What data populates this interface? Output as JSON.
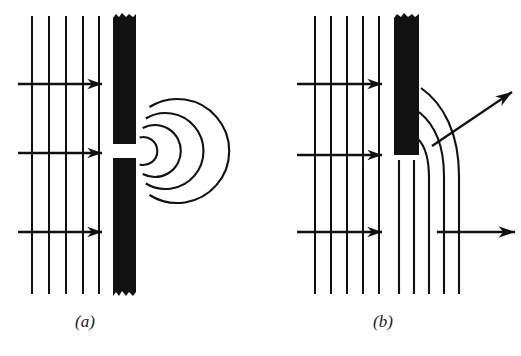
{
  "figure": {
    "background_color": "#ffffff",
    "ink_color": "#111111",
    "panels": [
      {
        "id": "a",
        "caption": "(a)",
        "caption_x": 85,
        "caption_y": 327,
        "description": "Plane waves incident on a barrier with a narrow slit; circular wavelets spread out beyond the slit",
        "incident_wavefronts": {
          "count": 5,
          "x_positions": [
            32,
            49,
            66,
            83,
            99
          ],
          "y_top": 16,
          "y_bottom": 294,
          "stroke_width": 2.0
        },
        "direction_arrows": [
          {
            "x1": 18,
            "y1": 84,
            "x2": 102,
            "y2": 84
          },
          {
            "x1": 18,
            "y1": 153,
            "x2": 102,
            "y2": 153
          },
          {
            "x1": 18,
            "y1": 232,
            "x2": 102,
            "y2": 232
          }
        ],
        "barrier": {
          "x": 113,
          "width": 23,
          "top_segment": {
            "y_top": 14,
            "y_bottom": 144
          },
          "bottom_segment": {
            "y_top": 158,
            "y_bottom": 296
          },
          "slit": {
            "y_top": 144,
            "y_bottom": 158,
            "height": 14
          },
          "fill": "#111111",
          "torn_edges": true
        },
        "diffracted_arcs": {
          "center_x": 136,
          "center_y": 151,
          "radii": [
            14,
            26,
            38,
            52
          ],
          "angle_span_degrees": 150,
          "stroke_width": 2.0
        }
      },
      {
        "id": "b",
        "caption": "(b)",
        "caption_x": 383,
        "caption_y": 327,
        "description": "Plane waves incident on a straight edge; wavefronts bend around the edge into the shadow region",
        "incident_wavefronts": {
          "count": 5,
          "x_positions": [
            315,
            331,
            347,
            363,
            379
          ],
          "y_top": 16,
          "y_bottom": 294,
          "stroke_width": 2.0
        },
        "direction_arrows": [
          {
            "x1": 297,
            "y1": 84,
            "x2": 382,
            "y2": 84
          },
          {
            "x1": 297,
            "y1": 155,
            "x2": 382,
            "y2": 155
          },
          {
            "x1": 297,
            "y1": 232,
            "x2": 382,
            "y2": 232
          }
        ],
        "barrier": {
          "x": 394,
          "width": 25,
          "y_top": 14,
          "y_bottom": 155,
          "fill": "#111111",
          "torn_edges": true
        },
        "bent_wavefronts": {
          "count": 5,
          "base_x_positions": [
            399,
            414,
            429,
            444,
            459
          ],
          "y_bottom": 294,
          "stroke_width": 2.0
        },
        "direction_arrows_out": [
          {
            "type": "diagonal",
            "x1": 432,
            "y1": 146,
            "x2": 512,
            "y2": 92,
            "label": "bent ray into shadow"
          },
          {
            "type": "straight",
            "x1": 437,
            "y1": 232,
            "x2": 515,
            "y2": 232,
            "label": "undeviated ray"
          }
        ]
      }
    ]
  }
}
